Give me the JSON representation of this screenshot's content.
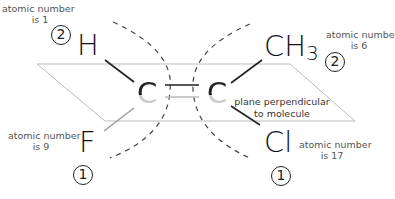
{
  "diagram": {
    "atoms": {
      "top_left": {
        "symbol": "H",
        "priority": "2",
        "label_line1": "atomic number",
        "label_line2": "is 1"
      },
      "top_right": {
        "symbol": "CH",
        "subscript": "3",
        "priority": "2",
        "label_line1": "atomic number",
        "label_line2": "is 6"
      },
      "bottom_left": {
        "symbol": "F",
        "priority": "1",
        "label_line1": "atomic number",
        "label_line2": "is 9"
      },
      "bottom_right": {
        "symbol": "Cl",
        "priority": "1",
        "label_line1": "atomic number",
        "label_line2": "is 17"
      },
      "center_left": {
        "symbol": "C"
      },
      "center_right": {
        "symbol": "C"
      }
    },
    "plane_label_line1": "plane perpendicular",
    "plane_label_line2": "to molecule",
    "colors": {
      "plane_edge": "#bbbbbb",
      "bond": "#222222",
      "dashed_arc": "#444444",
      "label_text": "#555555"
    }
  }
}
